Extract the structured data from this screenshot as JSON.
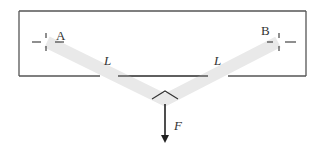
{
  "diagram": {
    "support_a": {
      "label": "A"
    },
    "support_b": {
      "label": "B"
    },
    "member_left": {
      "label": "L"
    },
    "member_right": {
      "label": "L"
    },
    "force": {
      "label": "F"
    },
    "colors": {
      "frame": "#555555",
      "member": "#e8e8e8",
      "arrow": "#222222",
      "text": "#333333"
    }
  }
}
